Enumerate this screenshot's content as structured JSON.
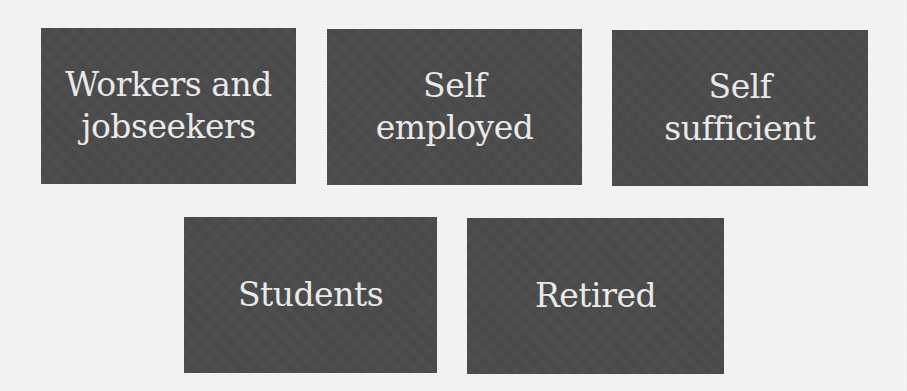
{
  "diagram": {
    "colors": {
      "background": "#f4f4f4",
      "box_fill": "#4a4a4a",
      "box_text": "#e9e9e9"
    },
    "rows": [
      {
        "boxes": [
          {
            "label": "Workers and\njobseekers"
          },
          {
            "label": "Self\nemployed"
          },
          {
            "label": "Self\nsufficient"
          }
        ]
      },
      {
        "boxes": [
          {
            "label": "Students"
          },
          {
            "label": "Retired"
          }
        ]
      }
    ]
  }
}
